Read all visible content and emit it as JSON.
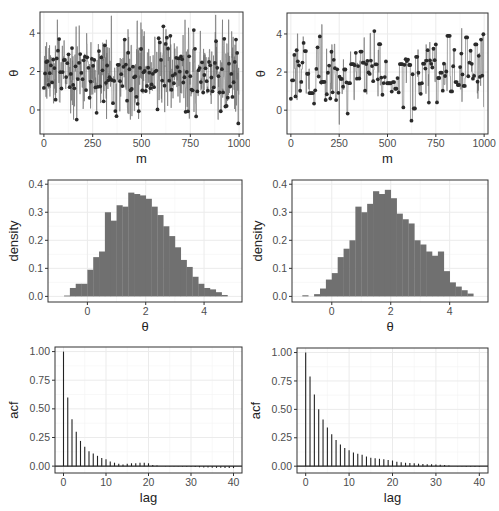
{
  "chart_data": [
    {
      "id": "trace-left",
      "type": "line",
      "title": "",
      "xlabel": "m",
      "ylabel": "θ",
      "xlim": [
        -20,
        1020
      ],
      "ylim": [
        -1.25,
        5.1
      ],
      "xticks": [
        0,
        250,
        500,
        750,
        1000
      ],
      "yticks": [
        0,
        2,
        4
      ],
      "grid": true,
      "description": "MCMC trace, fast mixing (mostly between 0 and 4.5)",
      "n": 1000,
      "summary": {
        "mean": 2.0,
        "sd": 1.0,
        "min": -0.7,
        "max": 4.9,
        "stickiness": 0.35
      },
      "highlights": [
        {
          "m": 0,
          "theta": 1.15
        },
        {
          "m": 270,
          "theta": -0.15
        },
        {
          "m": 345,
          "theta": 4.9
        },
        {
          "m": 745,
          "theta": -0.45
        },
        {
          "m": 880,
          "theta": 4.95
        },
        {
          "m": 995,
          "theta": -0.7
        }
      ]
    },
    {
      "id": "trace-right",
      "type": "line",
      "title": "",
      "xlabel": "m",
      "ylabel": "θ",
      "xlim": [
        -20,
        1020
      ],
      "ylim": [
        -1.25,
        5.1
      ],
      "xticks": [
        0,
        250,
        500,
        750,
        1000
      ],
      "yticks": [
        0,
        2,
        4
      ],
      "grid": true,
      "description": "MCMC trace, slow mixing with long flat runs",
      "n": 1000,
      "summary": {
        "mean": 1.9,
        "sd": 1.0,
        "min": -0.75,
        "max": 4.5,
        "stickiness": 0.8
      },
      "highlights": [
        {
          "m": 0,
          "theta": 0.6
        },
        {
          "m": 160,
          "theta": 4.5
        },
        {
          "m": 250,
          "theta": -0.75
        },
        {
          "m": 700,
          "theta": 3.45
        },
        {
          "m": 750,
          "theta": 3.45
        },
        {
          "m": 810,
          "theta": 3.9
        }
      ]
    },
    {
      "id": "hist-left",
      "type": "bar",
      "title": "",
      "xlabel": "θ",
      "ylabel": "density",
      "xlim": [
        -1.35,
        5.3
      ],
      "ylim": [
        -0.02,
        0.415
      ],
      "xticks": [
        0,
        2,
        4
      ],
      "yticks": [
        0.0,
        0.1,
        0.2,
        0.3,
        0.4
      ],
      "ytick_labels": [
        "0.0",
        "0.1",
        "0.2",
        "0.3",
        "0.4"
      ],
      "grid": true,
      "bin_start": -0.8,
      "bin_width": 0.2,
      "values": [
        0.003,
        0.03,
        0.045,
        0.045,
        0.095,
        0.14,
        0.16,
        0.3,
        0.27,
        0.325,
        0.32,
        0.37,
        0.365,
        0.36,
        0.348,
        0.32,
        0.29,
        0.25,
        0.215,
        0.175,
        0.13,
        0.105,
        0.07,
        0.045,
        0.03,
        0.025,
        0.015,
        0.005
      ]
    },
    {
      "id": "hist-right",
      "type": "bar",
      "title": "",
      "xlabel": "θ",
      "ylabel": "density",
      "xlim": [
        -1.35,
        5.3
      ],
      "ylim": [
        -0.02,
        0.415
      ],
      "xticks": [
        0,
        2,
        4
      ],
      "yticks": [
        0.0,
        0.1,
        0.2,
        0.3,
        0.4
      ],
      "ytick_labels": [
        "0.0",
        "0.1",
        "0.2",
        "0.3",
        "0.4"
      ],
      "grid": true,
      "bin_start": -1.0,
      "bin_width": 0.2,
      "values": [
        0.004,
        0.0,
        0.008,
        0.028,
        0.06,
        0.083,
        0.14,
        0.17,
        0.2,
        0.32,
        0.3,
        0.33,
        0.375,
        0.365,
        0.38,
        0.35,
        0.295,
        0.275,
        0.26,
        0.2,
        0.185,
        0.16,
        0.145,
        0.16,
        0.09,
        0.05,
        0.035,
        0.022,
        0.01
      ]
    },
    {
      "id": "acf-left",
      "type": "bar",
      "title": "",
      "xlabel": "lag",
      "ylabel": "acf",
      "xlim": [
        -2,
        42
      ],
      "ylim": [
        -0.06,
        1.04
      ],
      "xticks": [
        0,
        10,
        20,
        30,
        40
      ],
      "yticks": [
        0.0,
        0.25,
        0.5,
        0.75,
        1.0
      ],
      "ytick_labels": [
        "0.00",
        "0.25",
        "0.50",
        "0.75",
        "1.00"
      ],
      "grid": true,
      "lags": [
        0,
        1,
        2,
        3,
        4,
        5,
        6,
        7,
        8,
        9,
        10,
        11,
        12,
        13,
        14,
        15,
        16,
        17,
        18,
        19,
        20,
        21,
        22,
        23,
        24,
        25,
        26,
        27,
        28,
        29,
        30,
        31,
        32,
        33,
        34,
        35,
        36,
        37,
        38,
        39,
        40
      ],
      "values": [
        1.0,
        0.6,
        0.41,
        0.3,
        0.22,
        0.17,
        0.13,
        0.11,
        0.09,
        0.07,
        0.06,
        0.04,
        0.03,
        0.02,
        0.015,
        0.02,
        0.025,
        0.025,
        0.03,
        0.03,
        0.025,
        0.01,
        0.005,
        0.0,
        -0.002,
        -0.003,
        -0.003,
        -0.004,
        -0.004,
        -0.005,
        -0.005,
        -0.008,
        -0.01,
        -0.012,
        -0.013,
        -0.014,
        -0.015,
        -0.015,
        -0.016,
        -0.016,
        -0.017
      ]
    },
    {
      "id": "acf-right",
      "type": "bar",
      "title": "",
      "xlabel": "lag",
      "ylabel": "acf",
      "xlim": [
        -2,
        42
      ],
      "ylim": [
        -0.06,
        1.04
      ],
      "xticks": [
        0,
        10,
        20,
        30,
        40
      ],
      "yticks": [
        0.0,
        0.25,
        0.5,
        0.75,
        1.0
      ],
      "ytick_labels": [
        "0.00",
        "0.25",
        "0.50",
        "0.75",
        "1.00"
      ],
      "grid": true,
      "lags": [
        0,
        1,
        2,
        3,
        4,
        5,
        6,
        7,
        8,
        9,
        10,
        11,
        12,
        13,
        14,
        15,
        16,
        17,
        18,
        19,
        20,
        21,
        22,
        23,
        24,
        25,
        26,
        27,
        28,
        29,
        30,
        31,
        32,
        33,
        34,
        35,
        36,
        37,
        38,
        39,
        40
      ],
      "values": [
        1.0,
        0.79,
        0.63,
        0.5,
        0.41,
        0.34,
        0.28,
        0.23,
        0.19,
        0.16,
        0.14,
        0.12,
        0.11,
        0.1,
        0.085,
        0.075,
        0.07,
        0.065,
        0.06,
        0.055,
        0.05,
        0.04,
        0.035,
        0.03,
        0.027,
        0.025,
        0.022,
        0.02,
        0.018,
        0.016,
        0.014,
        0.012,
        0.01,
        0.005,
        0.0,
        -0.002,
        -0.003,
        -0.004,
        -0.005,
        -0.005,
        -0.006
      ]
    }
  ],
  "style": {
    "panel_bg": "#ffffff",
    "grid_color": "#ebebeb",
    "border_color": "#333333",
    "fill_color": "#707070",
    "line_color": "#6e6e6e",
    "point_color": "#2a2a2a",
    "acf_color": "#222222",
    "tick_text_color": "#4d4d4d",
    "axis_title_color": "#222222"
  }
}
